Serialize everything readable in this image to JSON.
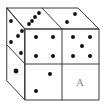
{
  "diagram": {
    "type": "dice-cube-2x2x2",
    "width": 105,
    "height": 106,
    "colors": {
      "background": "#ffffff",
      "edge": "#3a3a3a",
      "pip": "#111111",
      "label": "#8a8a8a"
    },
    "outline": {
      "top_face": [
        [
          7,
          8
        ],
        [
          78,
          8
        ],
        [
          99,
          29
        ],
        [
          25,
          29
        ]
      ],
      "front_face": [
        [
          25,
          29
        ],
        [
          99,
          29
        ],
        [
          99,
          100
        ],
        [
          25,
          100
        ]
      ],
      "left_face": [
        [
          7,
          8
        ],
        [
          25,
          29
        ],
        [
          25,
          100
        ],
        [
          7,
          81
        ]
      ]
    },
    "dividers": [
      {
        "name": "top-face-divider",
        "from": [
          42,
          8
        ],
        "to": [
          62,
          29
        ]
      },
      {
        "name": "front-face-vertical-divider",
        "from": [
          62,
          29
        ],
        "to": [
          62,
          100
        ]
      },
      {
        "name": "front-face-horizontal-divider",
        "from": [
          25,
          64
        ],
        "to": [
          99,
          64
        ]
      },
      {
        "name": "left-face-divider",
        "from": [
          7,
          45
        ],
        "to": [
          25,
          64
        ]
      }
    ],
    "faces": [
      {
        "name": "top-face-left-die",
        "pip_count": 4,
        "pips": [
          [
            39,
            13
          ],
          [
            35,
            17
          ],
          [
            32,
            21
          ],
          [
            29,
            24
          ]
        ],
        "pip_radius": 1.9
      },
      {
        "name": "top-face-right-die",
        "pip_count": 2,
        "pips": [
          [
            75,
            14
          ],
          [
            67,
            22
          ]
        ],
        "pip_radius": 1.9
      },
      {
        "name": "left-face-upper-die",
        "pip_count": 5,
        "pips": [
          [
            11,
            21
          ],
          [
            22,
            31
          ],
          [
            18,
            36
          ],
          [
            11,
            42
          ],
          [
            21,
            53
          ]
        ],
        "pip_radius": 1.9
      },
      {
        "name": "left-face-lower-die",
        "pip_count": 1,
        "pips": [
          [
            16,
            71
          ]
        ],
        "pip_radius": 2.4
      },
      {
        "name": "front-face-top-left-die",
        "pip_count": 4,
        "pips": [
          [
            36,
            37
          ],
          [
            53,
            37
          ],
          [
            36,
            56
          ],
          [
            53,
            56
          ]
        ],
        "pip_radius": 2.0
      },
      {
        "name": "front-face-top-right-die",
        "pip_count": 5,
        "pips": [
          [
            73,
            37
          ],
          [
            90,
            37
          ],
          [
            82,
            46
          ],
          [
            73,
            56
          ],
          [
            90,
            56
          ]
        ],
        "pip_radius": 2.0
      },
      {
        "name": "front-face-bottom-left-die",
        "pip_count": 2,
        "pips": [
          [
            50,
            74
          ],
          [
            36,
            91
          ]
        ],
        "pip_radius": 2.0
      },
      {
        "name": "front-face-bottom-right-die",
        "pip_count": null,
        "pips": [],
        "label": "A",
        "label_position": [
          80,
          86
        ]
      }
    ]
  }
}
